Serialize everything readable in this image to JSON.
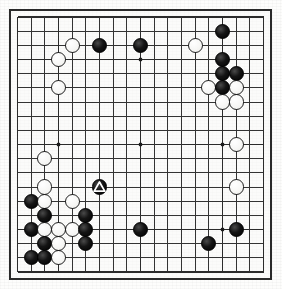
{
  "diagram": {
    "kind": "go-board-diagram",
    "board_size": 19,
    "caption": "",
    "colors": {
      "black_stone": "#000000",
      "white_stone": "#ffffff",
      "grid_line": "#333333",
      "board_border": "#2a2a2a",
      "paper": "#fdfdfc"
    },
    "star_points": [
      [
        4,
        4
      ],
      [
        10,
        4
      ],
      [
        16,
        4
      ],
      [
        4,
        10
      ],
      [
        10,
        10
      ],
      [
        16,
        10
      ],
      [
        4,
        16
      ],
      [
        10,
        16
      ],
      [
        16,
        16
      ]
    ],
    "stones": [
      {
        "color": "black",
        "col": 16,
        "row": 2,
        "mark": ""
      },
      {
        "color": "white",
        "col": 5,
        "row": 3,
        "mark": ""
      },
      {
        "color": "black",
        "col": 7,
        "row": 3,
        "mark": ""
      },
      {
        "color": "black",
        "col": 10,
        "row": 3,
        "mark": ""
      },
      {
        "color": "white",
        "col": 14,
        "row": 3,
        "mark": ""
      },
      {
        "color": "white",
        "col": 4,
        "row": 4,
        "mark": ""
      },
      {
        "color": "black",
        "col": 16,
        "row": 4,
        "mark": ""
      },
      {
        "color": "black",
        "col": 16,
        "row": 5,
        "mark": ""
      },
      {
        "color": "black",
        "col": 17,
        "row": 5,
        "mark": ""
      },
      {
        "color": "white",
        "col": 4,
        "row": 6,
        "mark": ""
      },
      {
        "color": "white",
        "col": 15,
        "row": 6,
        "mark": ""
      },
      {
        "color": "black",
        "col": 16,
        "row": 6,
        "mark": ""
      },
      {
        "color": "white",
        "col": 17,
        "row": 6,
        "mark": ""
      },
      {
        "color": "white",
        "col": 16,
        "row": 7,
        "mark": ""
      },
      {
        "color": "white",
        "col": 17,
        "row": 7,
        "mark": ""
      },
      {
        "color": "white",
        "col": 17,
        "row": 10,
        "mark": ""
      },
      {
        "color": "white",
        "col": 3,
        "row": 11,
        "mark": ""
      },
      {
        "color": "white",
        "col": 3,
        "row": 13,
        "mark": ""
      },
      {
        "color": "black",
        "col": 7,
        "row": 13,
        "mark": "triangle"
      },
      {
        "color": "white",
        "col": 17,
        "row": 13,
        "mark": ""
      },
      {
        "color": "black",
        "col": 2,
        "row": 14,
        "mark": ""
      },
      {
        "color": "white",
        "col": 3,
        "row": 14,
        "mark": ""
      },
      {
        "color": "white",
        "col": 5,
        "row": 14,
        "mark": ""
      },
      {
        "color": "black",
        "col": 3,
        "row": 15,
        "mark": ""
      },
      {
        "color": "black",
        "col": 6,
        "row": 15,
        "mark": ""
      },
      {
        "color": "black",
        "col": 2,
        "row": 16,
        "mark": ""
      },
      {
        "color": "white",
        "col": 3,
        "row": 16,
        "mark": ""
      },
      {
        "color": "white",
        "col": 4,
        "row": 16,
        "mark": ""
      },
      {
        "color": "white",
        "col": 5,
        "row": 16,
        "mark": ""
      },
      {
        "color": "black",
        "col": 6,
        "row": 16,
        "mark": ""
      },
      {
        "color": "black",
        "col": 10,
        "row": 16,
        "mark": ""
      },
      {
        "color": "black",
        "col": 17,
        "row": 16,
        "mark": ""
      },
      {
        "color": "black",
        "col": 3,
        "row": 17,
        "mark": ""
      },
      {
        "color": "white",
        "col": 4,
        "row": 17,
        "mark": ""
      },
      {
        "color": "black",
        "col": 6,
        "row": 17,
        "mark": ""
      },
      {
        "color": "black",
        "col": 15,
        "row": 17,
        "mark": ""
      },
      {
        "color": "black",
        "col": 2,
        "row": 18,
        "mark": ""
      },
      {
        "color": "black",
        "col": 3,
        "row": 18,
        "mark": ""
      },
      {
        "color": "white",
        "col": 4,
        "row": 18,
        "mark": ""
      }
    ]
  }
}
